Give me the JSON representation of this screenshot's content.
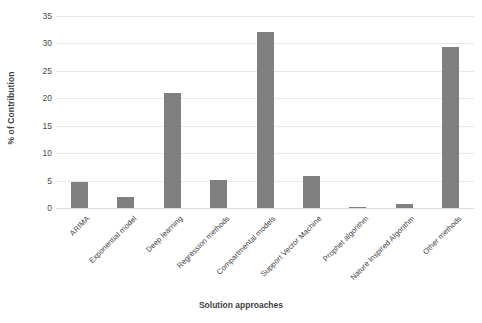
{
  "chart_data": {
    "type": "bar",
    "title": "",
    "xlabel": "Solution approaches",
    "ylabel": "% of Contribution",
    "ylim": [
      0,
      35
    ],
    "yticks": [
      0,
      5,
      10,
      15,
      20,
      25,
      30,
      35
    ],
    "grid": true,
    "legend": "none",
    "bar_color": "#808080",
    "categories": [
      "ARIMA",
      "Exponential model",
      "Deep learning",
      "Regression methods",
      "Compartmental models",
      "Support Vector Machine",
      "Prophet algorithm",
      "Nature Inspired Algorithm",
      "Other methods"
    ],
    "values": [
      4.8,
      2.0,
      21.0,
      5.1,
      32.0,
      5.8,
      0.1,
      0.8,
      29.4
    ]
  }
}
